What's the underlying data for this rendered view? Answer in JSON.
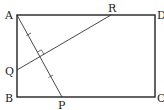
{
  "figure": {
    "type": "geometry",
    "points": {
      "A": {
        "label": "A",
        "x": 17,
        "y": 15
      },
      "B": {
        "label": "B",
        "x": 17,
        "y": 97
      },
      "C": {
        "label": "C",
        "x": 155,
        "y": 97
      },
      "D": {
        "label": "D",
        "x": 155,
        "y": 15
      },
      "P": {
        "label": "P",
        "x": 62,
        "y": 97
      },
      "Q": {
        "label": "Q",
        "x": 17,
        "y": 70
      },
      "R": {
        "label": "R",
        "x": 111,
        "y": 15
      }
    },
    "segments": [
      "AB",
      "BC",
      "CD",
      "DA",
      "AP",
      "QR"
    ],
    "marks": {
      "right_angle": "AP ⟂ QR",
      "equal_ticks": "AM = MP"
    },
    "colors": {
      "stroke": "#222222",
      "background": "#ffffff"
    }
  }
}
